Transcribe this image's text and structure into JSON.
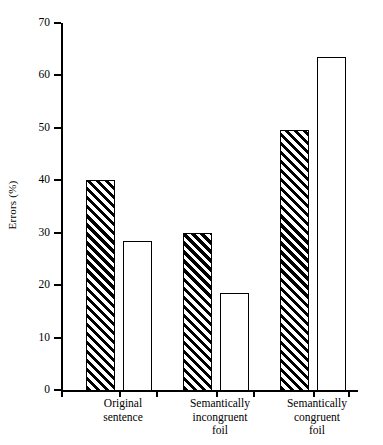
{
  "chart_data": {
    "type": "bar",
    "title": "",
    "subtitle": "",
    "xlabel": "",
    "ylabel": "Errors (%)",
    "ylim": [
      0,
      70
    ],
    "ytick_values": [
      0,
      10,
      20,
      30,
      40,
      50,
      60,
      70
    ],
    "ytick_labels": [
      "0",
      "10",
      "20",
      "30",
      "40",
      "50",
      "60",
      "70"
    ],
    "grid": false,
    "legend": null,
    "legend_position": "none",
    "categories": [
      "Original\nsentence",
      "Semantically\nincongruent\nfoil",
      "Semantically\ncongruent\nfoil"
    ],
    "series": [
      {
        "name": "hatched",
        "fill": "diagonal-hatch",
        "values": [
          40.0,
          30.0,
          49.5
        ]
      },
      {
        "name": "open",
        "fill": "white",
        "values": [
          28.5,
          18.5,
          63.5
        ]
      }
    ],
    "colors": {
      "axis": "#000000",
      "bar_outline": "#000000",
      "hatch": "#000000",
      "open_fill": "#ffffff",
      "background": "#ffffff"
    }
  },
  "axis": {
    "y_label": "Errors (%)",
    "ticks": [
      {
        "label": "70",
        "value": 70
      },
      {
        "label": "60",
        "value": 60
      },
      {
        "label": "50",
        "value": 50
      },
      {
        "label": "40",
        "value": 40
      },
      {
        "label": "30",
        "value": 30
      },
      {
        "label": "20",
        "value": 20
      },
      {
        "label": "10",
        "value": 10
      },
      {
        "label": "0",
        "value": 0
      }
    ]
  },
  "groups": [
    {
      "label": "Original\nsentence",
      "bars": [
        {
          "name": "original-sentence-hatched",
          "value": 40.0,
          "style": "hatched"
        },
        {
          "name": "original-sentence-open",
          "value": 28.5,
          "style": "open"
        }
      ]
    },
    {
      "label": "Semantically\nincongruent\nfoil",
      "bars": [
        {
          "name": "incongruent-foil-hatched",
          "value": 30.0,
          "style": "hatched"
        },
        {
          "name": "incongruent-foil-open",
          "value": 18.5,
          "style": "open"
        }
      ]
    },
    {
      "label": "Semantically\ncongruent\nfoil",
      "bars": [
        {
          "name": "congruent-foil-hatched",
          "value": 49.5,
          "style": "hatched"
        },
        {
          "name": "congruent-foil-open",
          "value": 63.5,
          "style": "open"
        }
      ]
    }
  ]
}
